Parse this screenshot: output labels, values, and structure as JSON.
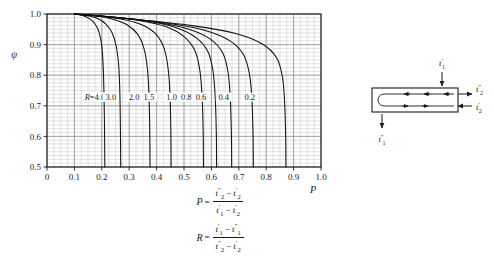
{
  "chart_data": {
    "type": "line",
    "title": "",
    "xlabel": "P",
    "ylabel": "ψ",
    "xlim": [
      0,
      1.0
    ],
    "ylim": [
      0.5,
      1.0
    ],
    "grid": true,
    "legend_position": "inline-curve-labels",
    "x_ticks": [
      "0",
      "0.1",
      "0.2",
      "0.3",
      "0.4",
      "0.5",
      "0.6",
      "0.7",
      "0.8",
      "0.9",
      "1.0"
    ],
    "x_tick_values": [
      0,
      0.1,
      0.2,
      0.3,
      0.4,
      0.5,
      0.6,
      0.7,
      0.8,
      0.9,
      1.0
    ],
    "y_ticks": [
      "0.5",
      "0.6",
      "0.7",
      "0.8",
      "0.9",
      "1.0"
    ],
    "y_tick_values": [
      0.5,
      0.6,
      0.7,
      0.8,
      0.9,
      1.0
    ],
    "x_minor_step": 0.025,
    "y_minor_step": 0.0125,
    "series_label_prefix": "R=",
    "series": [
      {
        "name": "4.0",
        "label": "R=4.0",
        "label_at": {
          "x": 0.175,
          "y": 0.725
        },
        "x": [
          0.1,
          0.13,
          0.155,
          0.175,
          0.19,
          0.2,
          0.205,
          0.208,
          0.21,
          0.211
        ],
        "values": [
          1.0,
          0.995,
          0.985,
          0.968,
          0.94,
          0.895,
          0.83,
          0.74,
          0.62,
          0.5
        ]
      },
      {
        "name": "3.0",
        "label": "3.0",
        "label_at": {
          "x": 0.233,
          "y": 0.725
        },
        "x": [
          0.1,
          0.145,
          0.185,
          0.215,
          0.238,
          0.253,
          0.262,
          0.266,
          0.268,
          0.269
        ],
        "values": [
          1.0,
          0.995,
          0.985,
          0.967,
          0.938,
          0.893,
          0.828,
          0.74,
          0.62,
          0.5
        ]
      },
      {
        "name": "2.0",
        "label": "2.0",
        "label_at": {
          "x": 0.318,
          "y": 0.725
        },
        "x": [
          0.1,
          0.175,
          0.24,
          0.292,
          0.33,
          0.353,
          0.366,
          0.372,
          0.375,
          0.376
        ],
        "values": [
          1.0,
          0.994,
          0.983,
          0.965,
          0.935,
          0.89,
          0.825,
          0.738,
          0.618,
          0.5
        ]
      },
      {
        "name": "1.5",
        "label": "1.5",
        "label_at": {
          "x": 0.372,
          "y": 0.725
        },
        "x": [
          0.1,
          0.195,
          0.28,
          0.35,
          0.4,
          0.428,
          0.442,
          0.449,
          0.452,
          0.453
        ],
        "values": [
          1.0,
          0.993,
          0.982,
          0.963,
          0.932,
          0.886,
          0.822,
          0.735,
          0.616,
          0.5
        ]
      },
      {
        "name": "1.0",
        "label": "1.0",
        "label_at": {
          "x": 0.455,
          "y": 0.725
        },
        "x": [
          0.1,
          0.225,
          0.34,
          0.435,
          0.5,
          0.54,
          0.558,
          0.566,
          0.57,
          0.571
        ],
        "values": [
          1.0,
          0.991,
          0.978,
          0.958,
          0.926,
          0.88,
          0.815,
          0.73,
          0.612,
          0.5
        ]
      },
      {
        "name": "0.8",
        "label": "0.8",
        "label_at": {
          "x": 0.508,
          "y": 0.725
        },
        "x": [
          0.1,
          0.24,
          0.368,
          0.472,
          0.545,
          0.588,
          0.606,
          0.614,
          0.618,
          0.619
        ],
        "values": [
          1.0,
          0.99,
          0.976,
          0.955,
          0.922,
          0.876,
          0.812,
          0.727,
          0.61,
          0.5
        ]
      },
      {
        "name": "0.6",
        "label": "0.6",
        "label_at": {
          "x": 0.562,
          "y": 0.725
        },
        "x": [
          0.1,
          0.258,
          0.4,
          0.515,
          0.596,
          0.642,
          0.661,
          0.669,
          0.673,
          0.674
        ],
        "values": [
          1.0,
          0.988,
          0.973,
          0.951,
          0.918,
          0.872,
          0.808,
          0.724,
          0.608,
          0.5
        ]
      },
      {
        "name": "0.4",
        "label": "0.4",
        "label_at": {
          "x": 0.645,
          "y": 0.725
        },
        "x": [
          0.1,
          0.285,
          0.448,
          0.578,
          0.668,
          0.718,
          0.739,
          0.748,
          0.752,
          0.753
        ],
        "values": [
          1.0,
          0.986,
          0.969,
          0.946,
          0.912,
          0.866,
          0.803,
          0.72,
          0.605,
          0.5
        ]
      },
      {
        "name": "0.2",
        "label": "0.2",
        "label_at": {
          "x": 0.74,
          "y": 0.725
        },
        "x": [
          0.1,
          0.33,
          0.53,
          0.685,
          0.786,
          0.838,
          0.859,
          0.867,
          0.871,
          0.872
        ],
        "values": [
          1.0,
          0.982,
          0.962,
          0.937,
          0.902,
          0.857,
          0.796,
          0.715,
          0.602,
          0.5
        ]
      }
    ]
  },
  "formulas": [
    {
      "name": "P-definition",
      "lhs": "P",
      "eq": "=",
      "numerator": [
        {
          "base": "t",
          "sup": "″",
          "sub": "2"
        },
        {
          "op": "−"
        },
        {
          "base": "t",
          "sup": "′",
          "sub": "2"
        }
      ],
      "denominator": [
        {
          "base": "t",
          "sup": "′",
          "sub": "1"
        },
        {
          "op": "−"
        },
        {
          "base": "t",
          "sup": "′",
          "sub": "2"
        }
      ]
    },
    {
      "name": "R-definition",
      "lhs": "R",
      "eq": "=",
      "numerator": [
        {
          "base": "t",
          "sup": "′",
          "sub": "1"
        },
        {
          "op": "−"
        },
        {
          "base": "t",
          "sup": "″",
          "sub": "1"
        }
      ],
      "denominator": [
        {
          "base": "t",
          "sup": "″",
          "sub": "2"
        },
        {
          "op": "−"
        },
        {
          "base": "t",
          "sup": "′",
          "sub": "2"
        }
      ]
    }
  ],
  "diagram": {
    "name": "shell-and-tube-heat-exchanger",
    "labels": {
      "inlet_top": {
        "base": "t",
        "sup": "′",
        "sub": "1"
      },
      "outlet_bottom": {
        "base": "t",
        "sup": "″",
        "sub": "1"
      },
      "outlet_right_upper": {
        "base": "t",
        "sup": "″",
        "sub": "2"
      },
      "inlet_right_lower": {
        "base": "t",
        "sup": "′",
        "sub": "2"
      }
    }
  },
  "colors": {
    "ink": "#1a1a1a",
    "grid_major": "#8c8c8c",
    "grid_minor": "#c4c4c4",
    "curve": "#111111",
    "background": "#ffffff"
  }
}
